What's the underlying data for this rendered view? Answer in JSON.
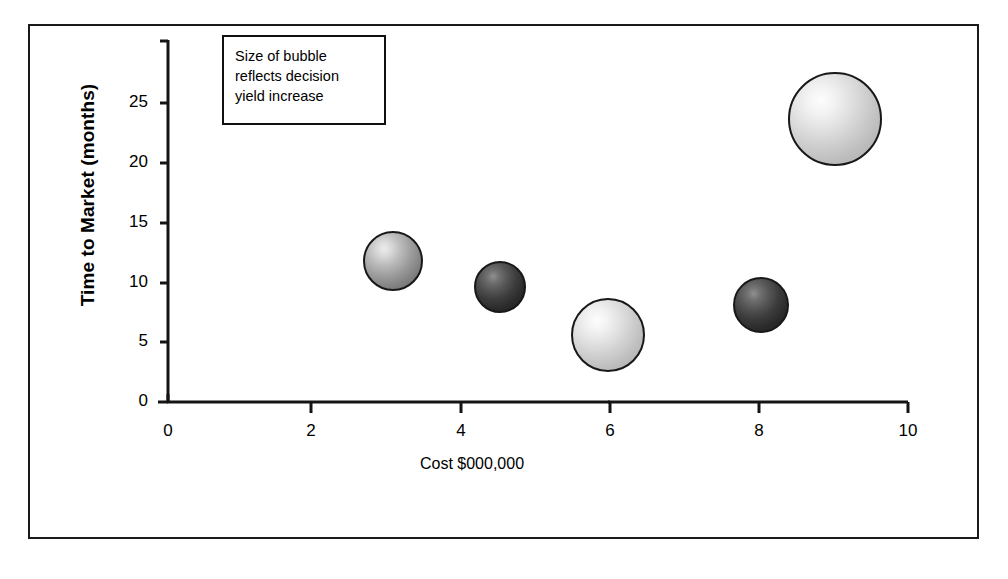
{
  "figure": {
    "note_box": {
      "lines": [
        "Size of bubble",
        "reflects decision",
        "yield increase"
      ]
    },
    "axes": {
      "x_title": "Cost $000,000",
      "y_title": "Time to Market (months)",
      "x_ticks": [
        "0",
        "2",
        "4",
        "6",
        "8",
        "10"
      ],
      "y_ticks": [
        "0",
        "5",
        "10",
        "15",
        "20",
        "25"
      ]
    }
  },
  "chart_data": {
    "type": "scatter",
    "title": "",
    "subtitle": "",
    "xlabel": "Cost $000,000",
    "ylabel": "Time to Market (months)",
    "xlim": [
      0,
      10
    ],
    "ylim": [
      0,
      27
    ],
    "xticks": [
      0,
      2,
      4,
      6,
      8,
      10
    ],
    "yticks": [
      0,
      5,
      10,
      15,
      20,
      25
    ],
    "grid": false,
    "legend": false,
    "size_encoding": "Size of bubble reflects decision yield increase",
    "annotations": [
      {
        "text": "Size of bubble reflects decision yield increase",
        "x_px": 222,
        "y_px": 35
      }
    ],
    "points": [
      {
        "label": "Option 1",
        "x": 3.05,
        "y": 11.8,
        "radius_px": 30,
        "shade": "mid",
        "shade_hex": "#9d9d9d"
      },
      {
        "label": "Option 2",
        "x": 4.5,
        "y": 9.6,
        "radius_px": 26,
        "shade": "dark",
        "shade_hex": "#3c3c3c"
      },
      {
        "label": "Option 3",
        "x": 5.95,
        "y": 5.6,
        "radius_px": 37,
        "shade": "light",
        "shade_hex": "#cfcfcf"
      },
      {
        "label": "Option 4",
        "x": 8.02,
        "y": 8.1,
        "radius_px": 28,
        "shade": "dark",
        "shade_hex": "#3c3c3c"
      },
      {
        "label": "Option 5",
        "x": 9.02,
        "y": 23.7,
        "radius_px": 47,
        "shade": "light",
        "shade_hex": "#d6d6d6"
      }
    ]
  }
}
